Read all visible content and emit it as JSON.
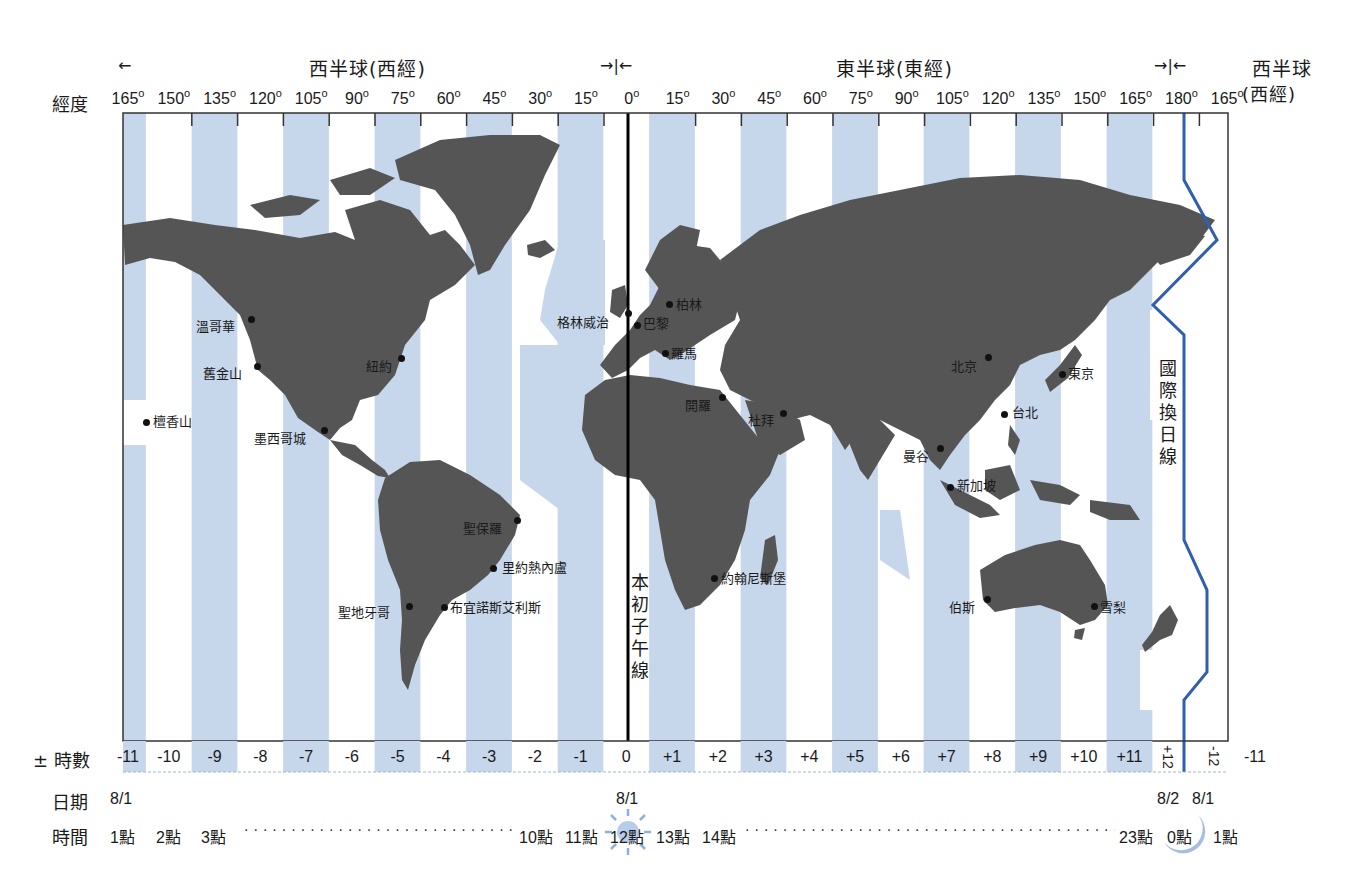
{
  "header": {
    "west_hemisphere": "西半球(西經)",
    "east_hemisphere": "東半球(東經)",
    "west_hemisphere_right": "西半球",
    "west_hemisphere_right_sub": "(西經)",
    "arrow_left": "←",
    "arrow_converge": "→|←",
    "longitude_label": "經度"
  },
  "longitudes": [
    "165",
    "150",
    "135",
    "120",
    "105",
    "90",
    "75",
    "60",
    "45",
    "30",
    "15",
    "0",
    "15",
    "30",
    "45",
    "60",
    "75",
    "90",
    "105",
    "120",
    "135",
    "150",
    "165",
    "180",
    "165"
  ],
  "degree_symbol": "o",
  "map": {
    "stripe_color": "#c6d6eb",
    "land_color": "#555555",
    "dateline_color": "#2f5fae",
    "prime_meridian_label": [
      "本",
      "初",
      "子",
      "午",
      "線"
    ],
    "dateline_label": [
      "國",
      "際",
      "換",
      "日",
      "線"
    ],
    "cities": [
      {
        "name": "溫哥華",
        "x": 251,
        "y": 319,
        "label_x": 196,
        "label_y": 316
      },
      {
        "name": "舊金山",
        "x": 257,
        "y": 366,
        "label_x": 203,
        "label_y": 363
      },
      {
        "name": "紐約",
        "x": 401,
        "y": 358,
        "label_x": 366,
        "label_y": 356
      },
      {
        "name": "檀香山",
        "x": 146,
        "y": 422,
        "label_x": 153,
        "label_y": 411
      },
      {
        "name": "墨西哥城",
        "x": 324,
        "y": 430,
        "label_x": 254,
        "label_y": 428
      },
      {
        "name": "聖保羅",
        "x": 517,
        "y": 520,
        "label_x": 463,
        "label_y": 518
      },
      {
        "name": "里約熱內盧",
        "x": 493,
        "y": 568,
        "label_x": 502,
        "label_y": 557
      },
      {
        "name": "聖地牙哥",
        "x": 409,
        "y": 606,
        "label_x": 338,
        "label_y": 602
      },
      {
        "name": "布宜諾斯艾利斯",
        "x": 444,
        "y": 607,
        "label_x": 450,
        "label_y": 597
      },
      {
        "name": "格林威治",
        "x": 628,
        "y": 313,
        "label_x": 557,
        "label_y": 312
      },
      {
        "name": "巴黎",
        "x": 637,
        "y": 325,
        "label_x": 643,
        "label_y": 313
      },
      {
        "name": "柏林",
        "x": 669,
        "y": 304,
        "label_x": 676,
        "label_y": 294
      },
      {
        "name": "羅馬",
        "x": 665,
        "y": 353,
        "label_x": 671,
        "label_y": 343
      },
      {
        "name": "開羅",
        "x": 722,
        "y": 397,
        "label_x": 685,
        "label_y": 395
      },
      {
        "name": "杜拜",
        "x": 783,
        "y": 413,
        "label_x": 748,
        "label_y": 410
      },
      {
        "name": "約翰尼斯堡",
        "x": 714,
        "y": 578,
        "label_x": 721,
        "label_y": 568
      },
      {
        "name": "北京",
        "x": 988,
        "y": 357,
        "label_x": 951,
        "label_y": 356
      },
      {
        "name": "東京",
        "x": 1062,
        "y": 374,
        "label_x": 1068,
        "label_y": 363
      },
      {
        "name": "台北",
        "x": 1004,
        "y": 414,
        "label_x": 1012,
        "label_y": 402
      },
      {
        "name": "曼谷",
        "x": 940,
        "y": 448,
        "label_x": 903,
        "label_y": 446
      },
      {
        "name": "新加坡",
        "x": 950,
        "y": 487,
        "label_x": 957,
        "label_y": 475
      },
      {
        "name": "伯斯",
        "x": 987,
        "y": 599,
        "label_x": 949,
        "label_y": 597
      },
      {
        "name": "雪梨",
        "x": 1094,
        "y": 606,
        "label_x": 1100,
        "label_y": 597
      }
    ]
  },
  "offsets_row": {
    "label": "± 時數",
    "cells": [
      {
        "text": "-11",
        "shade": true
      },
      {
        "text": "-10",
        "shade": false
      },
      {
        "text": "-9",
        "shade": true
      },
      {
        "text": "-8",
        "shade": false
      },
      {
        "text": "-7",
        "shade": true
      },
      {
        "text": "-6",
        "shade": false
      },
      {
        "text": "-5",
        "shade": true
      },
      {
        "text": "-4",
        "shade": false
      },
      {
        "text": "-3",
        "shade": true
      },
      {
        "text": "-2",
        "shade": false
      },
      {
        "text": "-1",
        "shade": true
      },
      {
        "text": "0",
        "shade": false
      },
      {
        "text": "+1",
        "shade": true
      },
      {
        "text": "+2",
        "shade": false
      },
      {
        "text": "+3",
        "shade": true
      },
      {
        "text": "+4",
        "shade": false
      },
      {
        "text": "+5",
        "shade": true
      },
      {
        "text": "+6",
        "shade": false
      },
      {
        "text": "+7",
        "shade": true
      },
      {
        "text": "+8",
        "shade": false
      },
      {
        "text": "+9",
        "shade": true
      },
      {
        "text": "+10",
        "shade": false
      },
      {
        "text": "+11",
        "shade": true
      },
      {
        "text": "+12",
        "shade": false
      },
      {
        "text": "-12",
        "shade": false
      },
      {
        "text": "-11",
        "shade": true
      }
    ]
  },
  "date_row": {
    "label": "日期",
    "left": "8/1",
    "center": "8/1",
    "right_a": "8/2",
    "right_b": "8/1"
  },
  "time_row": {
    "label": "時間",
    "items_left": [
      "1點",
      "2點",
      "3點"
    ],
    "items_mid": [
      "10點",
      "11點",
      "12點",
      "13點",
      "14點"
    ],
    "items_right": [
      "23點",
      "0點",
      "1點"
    ],
    "sun_icon": "sun",
    "moon_icon": "moon"
  }
}
